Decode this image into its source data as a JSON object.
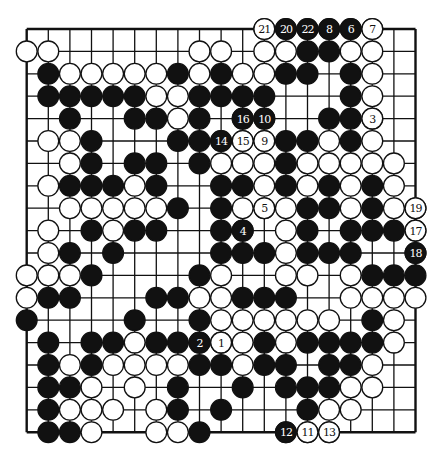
{
  "diagram": {
    "type": "go-board",
    "size": 19,
    "colors": {
      "background": "#ffffff",
      "line": "#111111",
      "black": "#111111",
      "white": "#ffffff"
    },
    "rows": [
      "...........WBBBBW..",
      "WW......WW.WWBBWW..",
      ".BWWWWWBWBWWBB.BW..",
      ".BBBBBWWBBBB...BW..",
      "..B..BBWB.BB..BBW..",
      ".WWB...BBBWWBBWBW..",
      "..WB.BB.BWWWBWWWWW.",
      ".WBBBWB..BBWBWBWBW.",
      "..WWWWWB.BWWWBBWBWW",
      ".W.BWBB..BB.WB.BBBW",
      ".WB.B....BBBWBBB..B",
      "WWWB....BW..WW.WBBB",
      "WBB...BBWWBBB..WWWW",
      "B....B..BWWWWWW.BW.",
      ".B.BBWBBBWWBWBBBBW.",
      ".BWBWWWWBBWBB.BBW..",
      ".BBW.W.B..B.BBBWW..",
      ".BWWW.WB.B...BWW...",
      ".BBW..WWB...BWW...."
    ],
    "labeled_moves": [
      {
        "n": "1",
        "color": "white",
        "col": 9,
        "row": 14
      },
      {
        "n": "2",
        "color": "black",
        "col": 8,
        "row": 14
      },
      {
        "n": "3",
        "color": "white",
        "col": 16,
        "row": 4
      },
      {
        "n": "4",
        "color": "black",
        "col": 10,
        "row": 9
      },
      {
        "n": "5",
        "color": "white",
        "col": 11,
        "row": 8
      },
      {
        "n": "6",
        "color": "black",
        "col": 15,
        "row": 0
      },
      {
        "n": "7",
        "color": "white",
        "col": 16,
        "row": 0
      },
      {
        "n": "8",
        "color": "black",
        "col": 14,
        "row": 0
      },
      {
        "n": "9",
        "color": "white",
        "col": 11,
        "row": 5
      },
      {
        "n": "10",
        "color": "black",
        "col": 11,
        "row": 4
      },
      {
        "n": "11",
        "color": "white",
        "col": 13,
        "row": 18
      },
      {
        "n": "12",
        "color": "black",
        "col": 12,
        "row": 18
      },
      {
        "n": "13",
        "color": "white",
        "col": 14,
        "row": 18
      },
      {
        "n": "14",
        "color": "black",
        "col": 9,
        "row": 5
      },
      {
        "n": "15",
        "color": "white",
        "col": 10,
        "row": 5
      },
      {
        "n": "16",
        "color": "black",
        "col": 10,
        "row": 4
      },
      {
        "n": "17",
        "color": "white",
        "col": 18,
        "row": 9
      },
      {
        "n": "18",
        "color": "black",
        "col": 18,
        "row": 10
      },
      {
        "n": "19",
        "color": "white",
        "col": 18,
        "row": 8
      },
      {
        "n": "20",
        "color": "black",
        "col": 12,
        "row": 0
      },
      {
        "n": "21",
        "color": "white",
        "col": 11,
        "row": 0
      },
      {
        "n": "22",
        "color": "black",
        "col": 13,
        "row": 0
      }
    ]
  }
}
